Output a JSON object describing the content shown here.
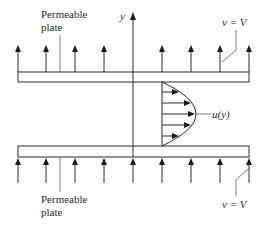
{
  "diagram": {
    "labels": {
      "top_plate": [
        "Permeable",
        "plate"
      ],
      "bottom_plate": [
        "Permeable",
        "plate"
      ],
      "axis_y": "y",
      "velocity_profile": "u(y)",
      "top_vertical_velocity": "v = V",
      "bottom_vertical_velocity": "v = V"
    },
    "top_arrows_count": 8,
    "bottom_arrows_count": 9,
    "profile_arrows_count": 5,
    "profile_shape": "parabolic",
    "colors": {
      "ink": "#2b2b2b",
      "background": "#ffffff"
    }
  }
}
